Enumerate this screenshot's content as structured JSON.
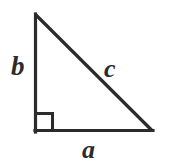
{
  "figure": {
    "kind": "right-triangle-diagram",
    "background_color": "#ffffff",
    "stroke_color": "#2b2b2b",
    "stroke_width": 3,
    "canvas": {
      "width": 171,
      "height": 165
    },
    "vertices": {
      "apex": {
        "x": 35,
        "y": 14
      },
      "right_angle": {
        "x": 35,
        "y": 132
      },
      "base_right": {
        "x": 153,
        "y": 132
      }
    },
    "right_angle_marker": {
      "name": "right-angle-square",
      "x": 35,
      "y": 113,
      "size": 19,
      "stroke_width": 3
    },
    "labels": {
      "leg_vertical": "b",
      "hypotenuse": "c",
      "leg_horizontal": "a"
    }
  }
}
